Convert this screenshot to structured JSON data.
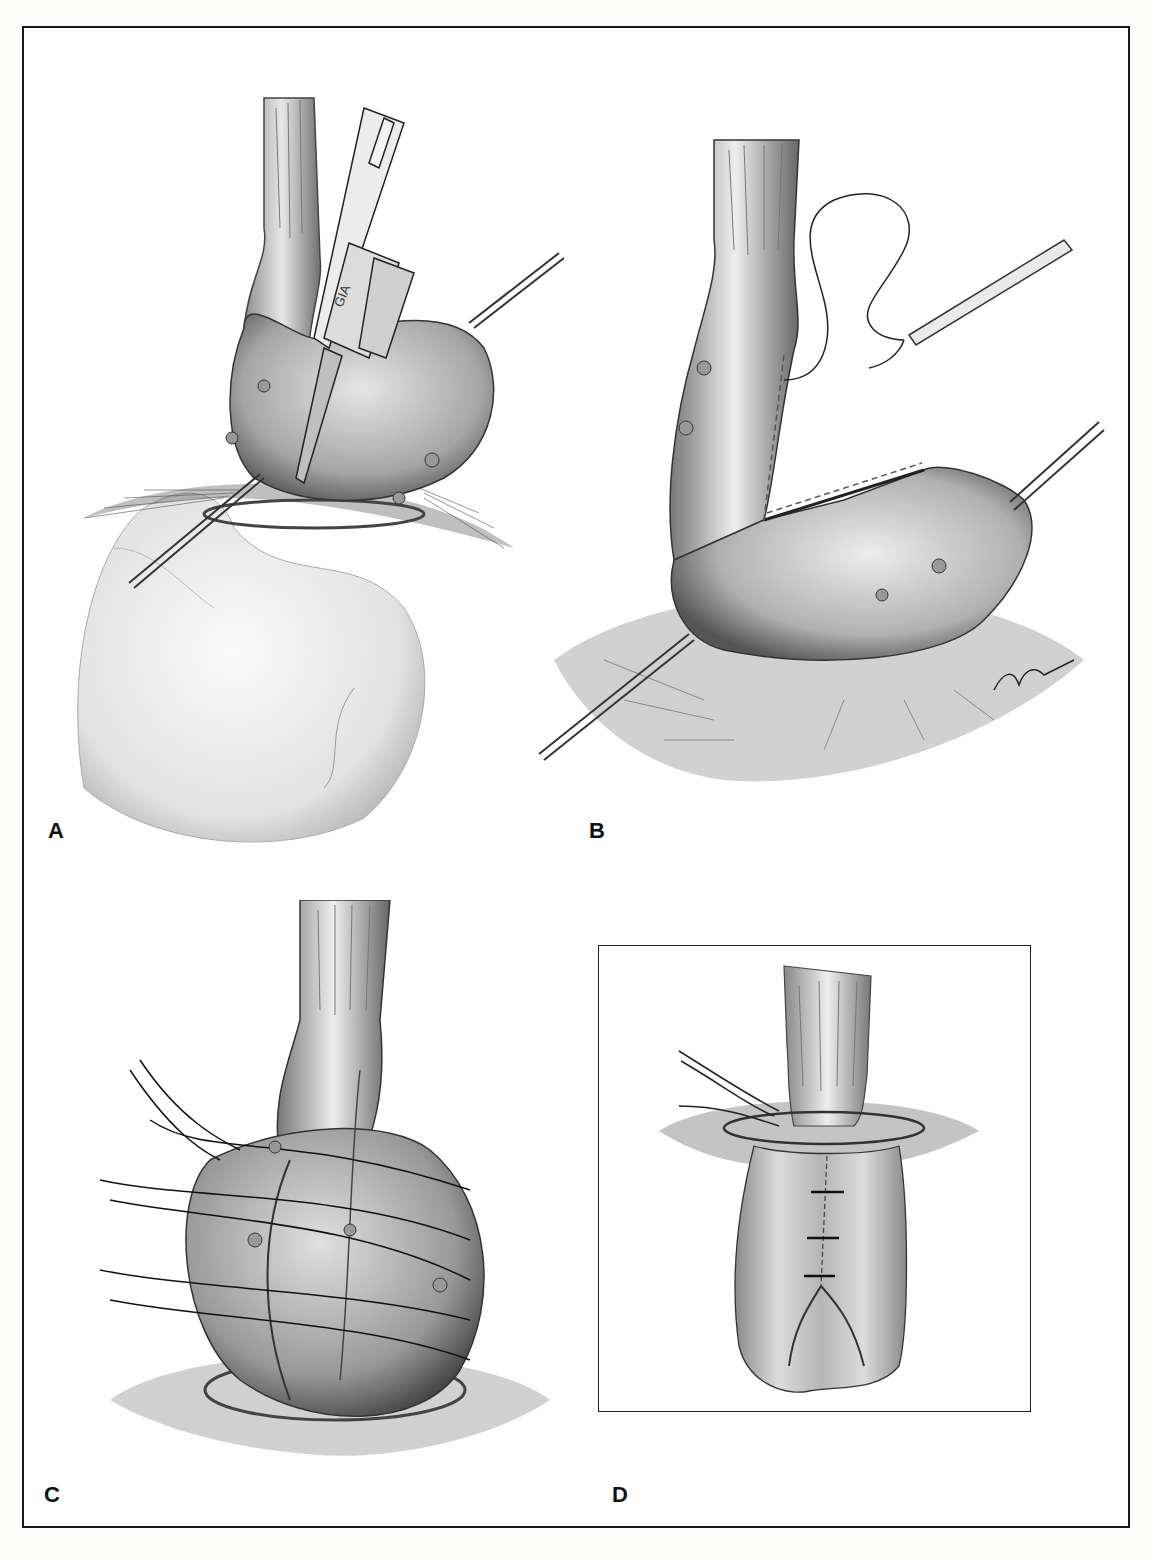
{
  "figure": {
    "type": "surgical-illustration",
    "style": "grayscale pencil/airbrush drawing",
    "colors": {
      "ink": "#1a1a1a",
      "paper": "#fdfdfc",
      "tissue_light": "#e6e6e6",
      "tissue_mid": "#9a9a9a",
      "tissue_dark": "#3a3a3a"
    },
    "panels": [
      {
        "id": "A",
        "label": "A",
        "description": "GIA stapler inserted between esophagus and gastric fundus; stay sutures retracting; stomach below",
        "instrument_text": "GIA"
      },
      {
        "id": "B",
        "label": "B",
        "description": "Divided staple line with running suture and needle holder; retraction sutures",
        "signature": "artist signature"
      },
      {
        "id": "C",
        "label": "C",
        "description": "Fundus wrapped around esophagus with interrupted sutures placed"
      },
      {
        "id": "D",
        "label": "D",
        "description": "Completed fundoplication with interrupted sutures, shown in boxed inset"
      }
    ]
  }
}
